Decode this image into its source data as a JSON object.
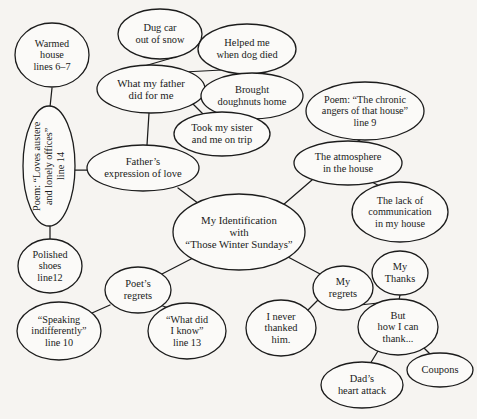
{
  "diagram": {
    "type": "concept-map",
    "title": "My Identification with “Those Winter Sundays”",
    "stroke_color": "#1c1c1c",
    "fill_color": "#fbfaf8",
    "background_color": "#f6f4f1",
    "nodes": [
      {
        "id": "warmed_house",
        "text": "Warmed\nhouse\nlines 6–7",
        "cx": 52,
        "cy": 55,
        "rx": 37,
        "ry": 32,
        "fs": 10.2,
        "orient": "h"
      },
      {
        "id": "poem_austere",
        "text": "Poem: “Loves austere\nand lonely offices”\nline 14",
        "cx": 49,
        "cy": 166,
        "rx": 26,
        "ry": 60,
        "fs": 10.2,
        "orient": "v"
      },
      {
        "id": "polished_shoes",
        "text": "Polished\nshoes\nline12",
        "cx": 50,
        "cy": 266,
        "rx": 32,
        "ry": 27,
        "fs": 10.2,
        "orient": "h"
      },
      {
        "id": "dug_car",
        "text": "Dug car\nout of snow",
        "cx": 160,
        "cy": 34,
        "rx": 42,
        "ry": 25,
        "fs": 10.4,
        "orient": "h"
      },
      {
        "id": "helped_dog",
        "text": "Helped me\nwhen dog died",
        "cx": 247,
        "cy": 49,
        "rx": 49,
        "ry": 25,
        "fs": 10.4,
        "orient": "h"
      },
      {
        "id": "what_father_did",
        "text": "What my father\ndid for me",
        "cx": 151,
        "cy": 89,
        "rx": 54,
        "ry": 24,
        "fs": 10.8,
        "orient": "h"
      },
      {
        "id": "brought_doughnuts",
        "text": "Brought\ndoughnuts home",
        "cx": 252,
        "cy": 96,
        "rx": 51,
        "ry": 23,
        "fs": 10.4,
        "orient": "h"
      },
      {
        "id": "took_sister",
        "text": "Took my sister\nand me on trip",
        "cx": 222,
        "cy": 134,
        "rx": 48,
        "ry": 22,
        "fs": 10.4,
        "orient": "h"
      },
      {
        "id": "poem_chronic",
        "text": "Poem: “The chronic\nangers of that house”\nline 9",
        "cx": 365,
        "cy": 111,
        "rx": 59,
        "ry": 29,
        "fs": 10.2,
        "orient": "h"
      },
      {
        "id": "fathers_expr",
        "text": "Father’s\nexpression of love",
        "cx": 143,
        "cy": 168,
        "rx": 56,
        "ry": 23,
        "fs": 10.6,
        "orient": "h"
      },
      {
        "id": "atmosphere",
        "text": "The atmosphere\nin the house",
        "cx": 348,
        "cy": 163,
        "rx": 54,
        "ry": 22,
        "fs": 10.4,
        "orient": "h"
      },
      {
        "id": "lack_comm",
        "text": "The lack of\ncommunication\nin my house",
        "cx": 400,
        "cy": 212,
        "rx": 48,
        "ry": 30,
        "fs": 10.2,
        "orient": "h"
      },
      {
        "id": "center",
        "text": "My Identification\nwith\n“Those Winter Sundays”",
        "cx": 239,
        "cy": 232,
        "rx": 66,
        "ry": 38,
        "fs": 10.8,
        "orient": "h"
      },
      {
        "id": "poets_regrets",
        "text": "Poet’s\nregrets",
        "cx": 138,
        "cy": 290,
        "rx": 33,
        "ry": 23,
        "fs": 10.4,
        "orient": "h"
      },
      {
        "id": "speaking_indiff",
        "text": "“Speaking\nindifferently”\nline 10",
        "cx": 59,
        "cy": 331,
        "rx": 42,
        "ry": 29,
        "fs": 10.2,
        "orient": "h"
      },
      {
        "id": "what_did_i_know",
        "text": "“What did\nI know”\nline 13",
        "cx": 187,
        "cy": 331,
        "rx": 39,
        "ry": 28,
        "fs": 10.2,
        "orient": "h"
      },
      {
        "id": "i_never_thanked",
        "text": "I never\nthanked\nhim.",
        "cx": 281,
        "cy": 328,
        "rx": 35,
        "ry": 28,
        "fs": 10.4,
        "orient": "h"
      },
      {
        "id": "my_regrets",
        "text": "My\nregrets",
        "cx": 343,
        "cy": 288,
        "rx": 30,
        "ry": 22,
        "fs": 10.4,
        "orient": "h"
      },
      {
        "id": "my_thanks",
        "text": "My\nThanks",
        "cx": 400,
        "cy": 273,
        "rx": 28,
        "ry": 22,
        "fs": 10.4,
        "orient": "h"
      },
      {
        "id": "but_how_thank",
        "text": "But\nhow I can\nthank...",
        "cx": 398,
        "cy": 327,
        "rx": 40,
        "ry": 28,
        "fs": 10.4,
        "orient": "h"
      },
      {
        "id": "dads_heart",
        "text": "Dad’s\nheart attack",
        "cx": 362,
        "cy": 385,
        "rx": 41,
        "ry": 23,
        "fs": 10.4,
        "orient": "h"
      },
      {
        "id": "coupons",
        "text": "Coupons",
        "cx": 440,
        "cy": 370,
        "rx": 33,
        "ry": 17,
        "fs": 10.4,
        "orient": "h"
      }
    ],
    "edges": [
      {
        "from": "warmed_house",
        "to": "poem_austere",
        "x1": 52,
        "y1": 88,
        "x2": 50,
        "y2": 107
      },
      {
        "from": "poem_austere",
        "to": "polished_shoes",
        "x1": 50,
        "y1": 226,
        "x2": 50,
        "y2": 240
      },
      {
        "from": "poem_austere",
        "to": "fathers_expr",
        "x1": 74,
        "y1": 170,
        "x2": 88,
        "y2": 170
      },
      {
        "from": "dug_car",
        "to": "what_father_did",
        "x1": 172,
        "y1": 58,
        "x2": 141,
        "y2": 67
      },
      {
        "from": "helped_dog",
        "to": "what_father_did",
        "x1": 222,
        "y1": 70,
        "x2": 184,
        "y2": 72
      },
      {
        "from": "what_father_did",
        "to": "brought_doughnuts",
        "x1": 204,
        "y1": 93,
        "x2": 202,
        "y2": 97
      },
      {
        "from": "what_father_did",
        "to": "took_sister",
        "x1": 192,
        "y1": 103,
        "x2": 205,
        "y2": 116
      },
      {
        "from": "what_father_did",
        "to": "fathers_expr",
        "x1": 149,
        "y1": 113,
        "x2": 147,
        "y2": 145
      },
      {
        "from": "poem_chronic",
        "to": "atmosphere",
        "x1": 360,
        "y1": 140,
        "x2": 356,
        "y2": 142
      },
      {
        "from": "atmosphere",
        "to": "lack_comm",
        "x1": 370,
        "y1": 181,
        "x2": 389,
        "y2": 191
      },
      {
        "from": "atmosphere",
        "to": "center",
        "x1": 312,
        "y1": 180,
        "x2": 283,
        "y2": 205
      },
      {
        "from": "fathers_expr",
        "to": "center",
        "x1": 178,
        "y1": 188,
        "x2": 203,
        "y2": 207
      },
      {
        "from": "center",
        "to": "poets_regrets",
        "x1": 193,
        "y1": 258,
        "x2": 160,
        "y2": 275
      },
      {
        "from": "center",
        "to": "my_regrets",
        "x1": 288,
        "y1": 257,
        "x2": 322,
        "y2": 275
      },
      {
        "from": "poets_regrets",
        "to": "speaking_indiff",
        "x1": 110,
        "y1": 305,
        "x2": 92,
        "y2": 313
      },
      {
        "from": "poets_regrets",
        "to": "what_did_i_know",
        "x1": 160,
        "y1": 305,
        "x2": 174,
        "y2": 310
      },
      {
        "from": "my_regrets",
        "to": "i_never_thanked",
        "x1": 318,
        "y1": 300,
        "x2": 308,
        "y2": 310
      },
      {
        "from": "my_regrets",
        "to": "but_how_thank",
        "x1": 360,
        "y1": 305,
        "x2": 378,
        "y2": 303
      },
      {
        "from": "my_thanks",
        "to": "but_how_thank",
        "x1": 400,
        "y1": 295,
        "x2": 399,
        "y2": 300
      },
      {
        "from": "but_how_thank",
        "to": "dads_heart",
        "x1": 378,
        "y1": 351,
        "x2": 370,
        "y2": 364
      },
      {
        "from": "but_how_thank",
        "to": "coupons",
        "x1": 424,
        "y1": 348,
        "x2": 432,
        "y2": 356
      }
    ]
  }
}
